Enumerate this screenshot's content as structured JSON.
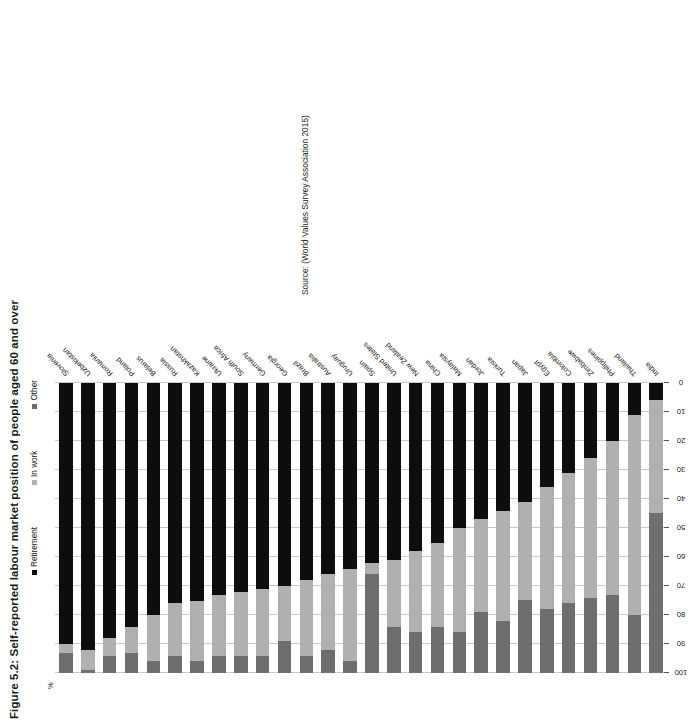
{
  "figure": {
    "title": "Figure 5.2: Self-reported labour market position of people aged 60 and over",
    "source": "Source: (World Values Survey Association 2015)",
    "axis_caption": "%"
  },
  "legend": {
    "items": [
      {
        "label": "Retirement",
        "color": "#0d0d0d"
      },
      {
        "label": "In work",
        "color": "#b0b0b0"
      },
      {
        "label": "Other",
        "color": "#6e6e6e"
      }
    ]
  },
  "chart_data": {
    "type": "bar",
    "title": "Figure 5.2: Self-reported labour market position of people aged 60 and over",
    "subtitle": "",
    "orientation": "horizontal-stacked",
    "stacked": true,
    "xlabel": "%",
    "ylabel": "",
    "xlim": [
      0,
      100
    ],
    "x_ticks": [
      100,
      90,
      80,
      70,
      60,
      50,
      40,
      30,
      20,
      10,
      0
    ],
    "x_axis_reversed": true,
    "grid": true,
    "legend_position": "top",
    "categories": [
      "Slovenia",
      "Uzbekistan",
      "Romania",
      "Poland",
      "Belarus",
      "Russia",
      "Kazakhstan",
      "Ukraine",
      "South Africa",
      "Germany",
      "Georgia",
      "Brazil",
      "Australia",
      "Uruguay",
      "Spain",
      "United States",
      "New Zealand",
      "China",
      "Malaysia",
      "Jordan",
      "Tunisia",
      "Japan",
      "Egypt",
      "Colombia",
      "Zimbabwe",
      "Philippines",
      "Thailand",
      "India"
    ],
    "series": [
      {
        "name": "Retirement",
        "color": "#0d0d0d",
        "values": [
          90,
          92,
          88,
          84,
          80,
          76,
          75,
          73,
          72,
          71,
          70,
          68,
          66,
          64,
          62,
          61,
          58,
          55,
          50,
          47,
          44,
          41,
          36,
          31,
          26,
          20,
          11,
          6
        ]
      },
      {
        "name": "In work",
        "color": "#b0b0b0",
        "values": [
          3,
          7,
          6,
          9,
          16,
          18,
          21,
          21,
          22,
          23,
          19,
          26,
          26,
          32,
          4,
          23,
          28,
          29,
          36,
          32,
          38,
          34,
          42,
          45,
          48,
          53,
          69,
          39
        ]
      },
      {
        "name": "Other",
        "color": "#6e6e6e",
        "values": [
          7,
          1,
          6,
          7,
          4,
          6,
          4,
          6,
          6,
          6,
          11,
          6,
          8,
          4,
          34,
          16,
          14,
          16,
          14,
          21,
          18,
          25,
          22,
          24,
          26,
          27,
          20,
          55
        ]
      }
    ]
  }
}
